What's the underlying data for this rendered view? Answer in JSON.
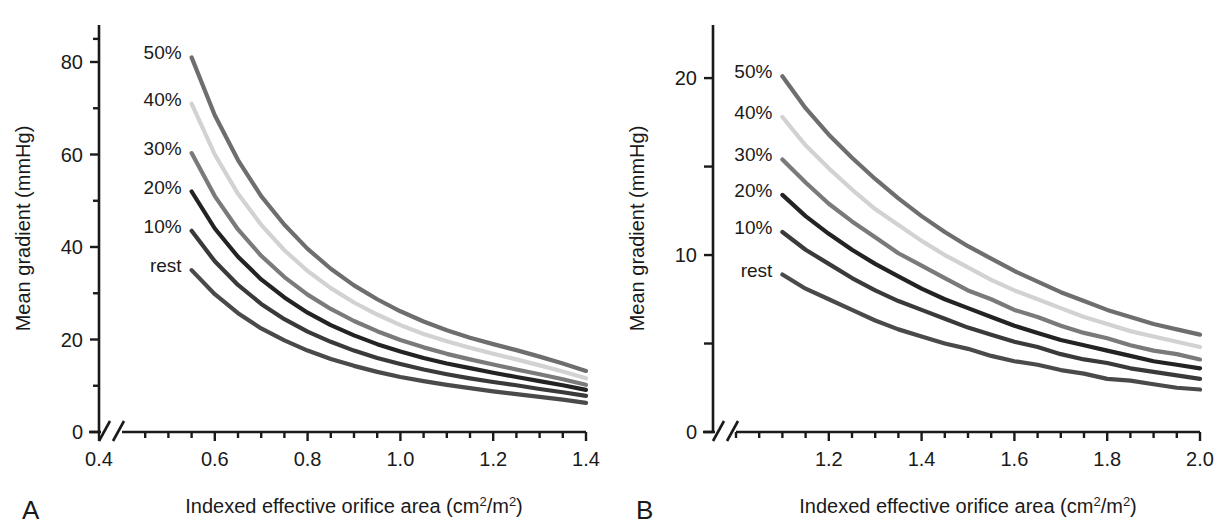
{
  "figure": {
    "background": "#ffffff",
    "panels": [
      {
        "letter": "A",
        "x_axis_title_main": "Indexed effective orifice area (cm",
        "x_axis_title_sup1": "2",
        "x_axis_title_mid": "/m",
        "x_axis_title_sup2": "2",
        "x_axis_title_end": ")",
        "y_axis_title": "Mean gradient (mmHg)"
      },
      {
        "letter": "B",
        "x_axis_title_main": "Indexed effective orifice area (cm",
        "x_axis_title_sup1": "2",
        "x_axis_title_mid": "/m",
        "x_axis_title_sup2": "2",
        "x_axis_title_end": ")",
        "y_axis_title": "Mean gradient (mmHg)"
      }
    ]
  },
  "chart_data": [
    {
      "panel": "A",
      "type": "line",
      "title": "",
      "xlabel": "Indexed effective orifice area (cm2/m2)",
      "ylabel": "Mean gradient (mmHg)",
      "xlim": [
        0.4,
        1.4
      ],
      "ylim": [
        0,
        88
      ],
      "axis_break_x": true,
      "axis_break_after": 0.4,
      "plot_x_start": 0.45,
      "grid": false,
      "x_ticks_major": [
        0.4,
        0.6,
        0.8,
        1.0,
        1.2,
        1.4
      ],
      "x_tick_labels": [
        "0.4",
        "0.6",
        "0.8",
        "1.0",
        "1.2",
        "1.4"
      ],
      "x_tick_minor_step": 0.05,
      "y_ticks_major": [
        0,
        20,
        40,
        60,
        80
      ],
      "y_tick_labels": [
        "0",
        "20",
        "40",
        "60",
        "80"
      ],
      "y_tick_minor_step": 10,
      "legend_position": "inline-left-of-curves",
      "x": [
        0.55,
        0.6,
        0.65,
        0.7,
        0.75,
        0.8,
        0.85,
        0.9,
        0.95,
        1.0,
        1.05,
        1.1,
        1.15,
        1.2,
        1.25,
        1.3,
        1.35,
        1.4
      ],
      "series": [
        {
          "name": "50%",
          "color": "#6e6e6e",
          "values": [
            81.0,
            68.5,
            58.8,
            51.0,
            44.8,
            39.6,
            35.3,
            31.7,
            28.7,
            26.1,
            23.9,
            22.0,
            20.4,
            19.0,
            17.7,
            16.3,
            14.8,
            13.2
          ]
        },
        {
          "name": "40%",
          "color": "#d2d2d2",
          "values": [
            71.0,
            60.0,
            51.5,
            44.8,
            39.3,
            34.8,
            31.1,
            28.0,
            25.4,
            23.1,
            21.2,
            19.6,
            18.2,
            16.9,
            15.7,
            14.4,
            13.1,
            11.6
          ]
        },
        {
          "name": "30%",
          "color": "#7a7a7a",
          "values": [
            60.3,
            51.0,
            43.8,
            38.1,
            33.5,
            29.7,
            26.6,
            24.0,
            21.8,
            19.9,
            18.3,
            16.9,
            15.7,
            14.6,
            13.5,
            12.5,
            11.4,
            10.2
          ]
        },
        {
          "name": "20%",
          "color": "#232323",
          "values": [
            52.0,
            44.0,
            37.9,
            33.0,
            29.1,
            25.8,
            23.1,
            20.9,
            19.0,
            17.4,
            16.0,
            14.8,
            13.8,
            12.8,
            11.9,
            11.0,
            10.1,
            9.1
          ]
        },
        {
          "name": "10%",
          "color": "#3a3a3a",
          "values": [
            43.5,
            36.9,
            31.8,
            27.7,
            24.4,
            21.7,
            19.5,
            17.6,
            16.0,
            14.7,
            13.5,
            12.5,
            11.6,
            10.8,
            10.1,
            9.3,
            8.6,
            7.8
          ]
        },
        {
          "name": "rest",
          "color": "#4a4a4a",
          "values": [
            35.0,
            29.8,
            25.7,
            22.4,
            19.8,
            17.6,
            15.8,
            14.3,
            13.0,
            11.9,
            11.0,
            10.2,
            9.5,
            8.8,
            8.2,
            7.6,
            7.0,
            6.3
          ]
        }
      ]
    },
    {
      "panel": "B",
      "type": "line",
      "title": "",
      "xlabel": "Indexed effective orifice area (cm2/m2)",
      "ylabel": "Mean gradient (mmHg)",
      "xlim": [
        1.0,
        2.0
      ],
      "ylim": [
        0,
        23
      ],
      "axis_break_x": true,
      "axis_break_after": 1.0,
      "plot_x_start": 1.04,
      "grid": false,
      "x_ticks_major": [
        1.2,
        1.4,
        1.6,
        1.8,
        2.0
      ],
      "x_tick_labels": [
        "1.2",
        "1.4",
        "1.6",
        "1.8",
        "2.0"
      ],
      "x_tick_minor_step": 0.05,
      "y_ticks_major": [
        0,
        5,
        10,
        15,
        20
      ],
      "y_tick_labels": [
        "0",
        "",
        "10",
        "",
        "20"
      ],
      "y_tick_minor_step": 5,
      "legend_position": "inline-left-of-curves",
      "x": [
        1.1,
        1.15,
        1.2,
        1.25,
        1.3,
        1.35,
        1.4,
        1.45,
        1.5,
        1.55,
        1.6,
        1.65,
        1.7,
        1.75,
        1.8,
        1.85,
        1.9,
        1.95,
        2.0
      ],
      "series": [
        {
          "name": "50%",
          "color": "#6e6e6e",
          "values": [
            20.1,
            18.3,
            16.8,
            15.5,
            14.3,
            13.2,
            12.2,
            11.3,
            10.5,
            9.8,
            9.1,
            8.5,
            7.9,
            7.4,
            6.9,
            6.5,
            6.1,
            5.8,
            5.5
          ]
        },
        {
          "name": "40%",
          "color": "#d2d2d2",
          "values": [
            17.8,
            16.2,
            14.9,
            13.7,
            12.6,
            11.7,
            10.8,
            10.0,
            9.3,
            8.6,
            8.0,
            7.5,
            7.0,
            6.5,
            6.1,
            5.7,
            5.4,
            5.1,
            4.8
          ]
        },
        {
          "name": "30%",
          "color": "#7a7a7a",
          "values": [
            15.4,
            14.1,
            12.9,
            11.9,
            11.0,
            10.1,
            9.4,
            8.7,
            8.0,
            7.5,
            6.9,
            6.5,
            6.0,
            5.6,
            5.3,
            4.9,
            4.6,
            4.4,
            4.1
          ]
        },
        {
          "name": "20%",
          "color": "#232323",
          "values": [
            13.4,
            12.2,
            11.2,
            10.3,
            9.5,
            8.8,
            8.1,
            7.5,
            7.0,
            6.5,
            6.0,
            5.6,
            5.2,
            4.9,
            4.6,
            4.3,
            4.0,
            3.8,
            3.6
          ]
        },
        {
          "name": "10%",
          "color": "#3a3a3a",
          "values": [
            11.3,
            10.3,
            9.5,
            8.7,
            8.0,
            7.4,
            6.9,
            6.4,
            5.9,
            5.5,
            5.1,
            4.8,
            4.4,
            4.1,
            3.9,
            3.6,
            3.4,
            3.2,
            3.0
          ]
        },
        {
          "name": "rest",
          "color": "#4a4a4a",
          "values": [
            8.9,
            8.1,
            7.5,
            6.9,
            6.3,
            5.8,
            5.4,
            5.0,
            4.7,
            4.3,
            4.0,
            3.8,
            3.5,
            3.3,
            3.0,
            2.9,
            2.7,
            2.5,
            2.4
          ]
        }
      ]
    }
  ]
}
